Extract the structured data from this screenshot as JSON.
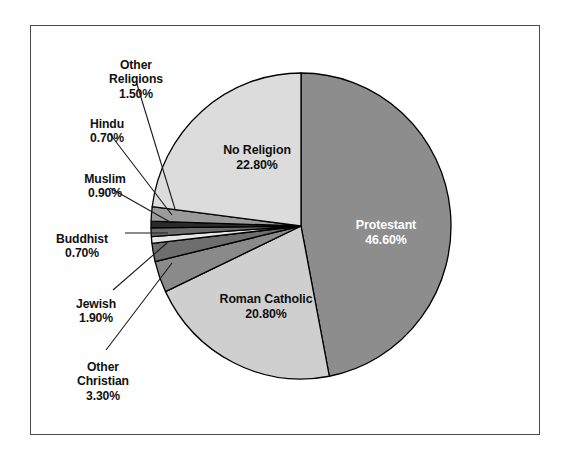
{
  "figure": {
    "background_color": "#ffffff",
    "frame_color": "#4a4a4a",
    "slice_outline_color": "#000000"
  },
  "chart_data": {
    "type": "pie",
    "title": "",
    "subtitle": "",
    "xlabel": "",
    "ylabel": "",
    "legend_position": "none",
    "grid": false,
    "units": "percent",
    "start_angle_deg": 0,
    "direction": "clockwise",
    "total": 99.2,
    "categories": [
      "Protestant",
      "Roman Catholic",
      "Other Christian",
      "Jewish",
      "Buddhist",
      "Muslim",
      "Hindu",
      "Other Religions",
      "No Religion"
    ],
    "values": [
      46.6,
      20.8,
      3.3,
      1.9,
      0.7,
      0.9,
      0.7,
      1.5,
      22.8
    ],
    "value_labels": [
      "46.60%",
      "20.80%",
      "3.30%",
      "1.90%",
      "0.70%",
      "0.90%",
      "0.70%",
      "1.50%",
      "22.80%"
    ],
    "slice_colors": [
      "#8d8d8d",
      "#cfcfcf",
      "#8a8a8a",
      "#6e6e6e",
      "#e6e6e6",
      "#6b6b6b",
      "#2b2b2b",
      "#9b9b9b",
      "#dcdcdc"
    ],
    "slices": [
      {
        "name": "Protestant",
        "value": 46.6,
        "label": "Protestant",
        "pct": "46.60%",
        "color": "#8d8d8d",
        "label_placement": "inside",
        "text_color": "#ffffff"
      },
      {
        "name": "Roman Catholic",
        "value": 20.8,
        "label": "Roman Catholic",
        "pct": "20.80%",
        "color": "#cfcfcf",
        "label_placement": "inside",
        "text_color": "#101010"
      },
      {
        "name": "Other Christian",
        "value": 3.3,
        "label": "Other\nChristian",
        "pct": "3.30%",
        "color": "#8a8a8a",
        "label_placement": "callout",
        "text_color": "#111111"
      },
      {
        "name": "Jewish",
        "value": 1.9,
        "label": "Jewish",
        "pct": "1.90%",
        "color": "#6e6e6e",
        "label_placement": "callout",
        "text_color": "#111111"
      },
      {
        "name": "Buddhist",
        "value": 0.7,
        "label": "Buddhist",
        "pct": "0.70%",
        "color": "#e6e6e6",
        "label_placement": "callout",
        "text_color": "#111111"
      },
      {
        "name": "Muslim",
        "value": 0.9,
        "label": "Muslim",
        "pct": "0.90%",
        "color": "#6b6b6b",
        "label_placement": "callout",
        "text_color": "#111111"
      },
      {
        "name": "Hindu",
        "value": 0.7,
        "label": "Hindu",
        "pct": "0.70%",
        "color": "#2b2b2b",
        "label_placement": "callout",
        "text_color": "#111111"
      },
      {
        "name": "Other Religions",
        "value": 1.5,
        "label": "Other\nReligions",
        "pct": "1.50%",
        "color": "#9b9b9b",
        "label_placement": "callout",
        "text_color": "#111111"
      },
      {
        "name": "No Religion",
        "value": 22.8,
        "label": "No Religion",
        "pct": "22.80%",
        "color": "#dcdcdc",
        "label_placement": "inside",
        "text_color": "#101010"
      }
    ]
  },
  "labels": {
    "other_religions_name": "Other\nReligions",
    "other_religions_pct": "1.50%",
    "hindu_name": "Hindu",
    "hindu_pct": "0.70%",
    "muslim_name": "Muslim",
    "muslim_pct": "0.90%",
    "buddhist_name": "Buddhist",
    "buddhist_pct": "0.70%",
    "jewish_name": "Jewish",
    "jewish_pct": "1.90%",
    "other_christian_name": "Other\nChristian",
    "other_christian_pct": "3.30%",
    "no_religion_name": "No Religion",
    "no_religion_pct": "22.80%",
    "protestant_name": "Protestant",
    "protestant_pct": "46.60%",
    "roman_catholic_name": "Roman Catholic",
    "roman_catholic_pct": "20.80%"
  }
}
